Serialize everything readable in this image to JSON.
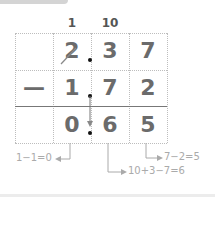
{
  "carries": [
    {
      "label": "1",
      "column": "ones"
    },
    {
      "label": "10",
      "column": "tenths"
    }
  ],
  "rows": [
    {
      "sign": "",
      "digits": [
        "2",
        "3",
        "7"
      ],
      "struck": [
        true,
        false,
        false
      ]
    },
    {
      "sign": "—",
      "digits": [
        "1",
        "7",
        "2"
      ],
      "struck": [
        false,
        false,
        false
      ]
    },
    {
      "sign": "",
      "digits": [
        "0",
        "6",
        "5"
      ],
      "struck": [
        false,
        false,
        false
      ]
    }
  ],
  "decimal_point": ".",
  "annotations": {
    "ones": "1−1=0",
    "tenths": "10+3−7=6",
    "hundredths": "7−2=5"
  },
  "colors": {
    "digit": "#6b6b6b",
    "grid": "#bdbdbd",
    "annotation": "#aaaaaa"
  }
}
